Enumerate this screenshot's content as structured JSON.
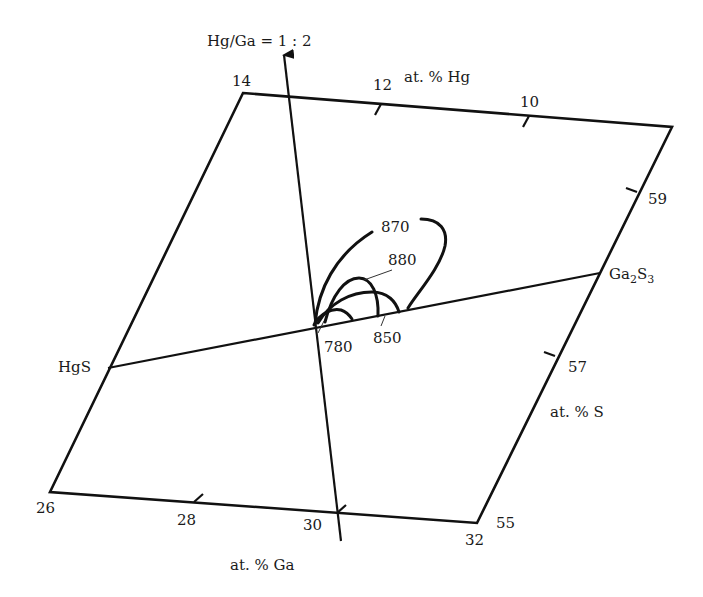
{
  "diagram": {
    "type": "ternary-section phase diagram (liquidus isotherms)",
    "ratio_axis_label": "Hg/Ga = 1 : 2",
    "section_line": {
      "start": "HgS",
      "end": "Ga2S3"
    },
    "compounds": {
      "left": "HgS",
      "right_main": "Ga",
      "right_sub1": "2",
      "right_main2": "S",
      "right_sub2": "3"
    },
    "axes": {
      "hg": {
        "label": "at. % Hg",
        "ticks": [
          "14",
          "12",
          "10"
        ]
      },
      "s": {
        "label": "at. % S",
        "ticks": [
          "59",
          "57",
          "55"
        ]
      },
      "ga": {
        "label": "at. % Ga",
        "ticks": [
          "26",
          "28",
          "30",
          "32"
        ]
      }
    },
    "isotherms": [
      {
        "label": "870",
        "unit": "°C"
      },
      {
        "label": "880",
        "unit": "°C"
      },
      {
        "label": "850",
        "unit": "°C"
      },
      {
        "label": "780",
        "unit": "°C"
      }
    ],
    "colors": {
      "ink": "#111111",
      "background": "#ffffff"
    }
  }
}
